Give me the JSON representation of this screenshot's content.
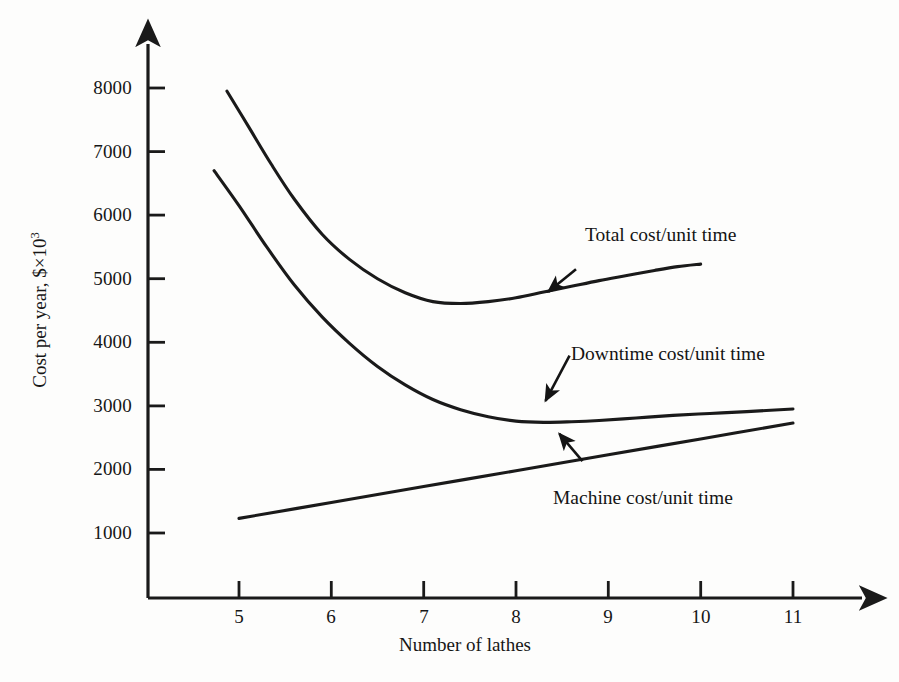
{
  "chart_data": {
    "type": "line",
    "title": "",
    "subtitle": "",
    "xlabel": "Number of lathes",
    "ylabel": "Cost per year, $×10",
    "ylabel_exponent": "3",
    "xlim": [
      4.3,
      11.7
    ],
    "ylim": [
      0,
      8600
    ],
    "xticks": [
      5,
      6,
      7,
      8,
      9,
      10,
      11
    ],
    "xticklabels": [
      "5",
      "6",
      "7",
      "8",
      "9",
      "10",
      "11"
    ],
    "yticks": [
      1000,
      2000,
      3000,
      4000,
      5000,
      6000,
      7000,
      8000
    ],
    "yticklabels": [
      "1000",
      "2000",
      "3000",
      "4000",
      "5000",
      "6000",
      "7000",
      "8000"
    ],
    "grid": false,
    "legend": "none",
    "axis_style": "arrow-tipped-spines",
    "line_color": "#1a1a1a",
    "series": [
      {
        "name": "Total cost/unit time",
        "label": "Total cost/unit time",
        "x": [
          4.87,
          5.1,
          5.35,
          5.6,
          5.9,
          6.2,
          6.5,
          6.8,
          7.1,
          7.4,
          7.7,
          8.0,
          8.3,
          8.6,
          8.9,
          9.2,
          9.5,
          9.75,
          10.0
        ],
        "values": [
          7950,
          7400,
          6800,
          6250,
          5700,
          5300,
          5000,
          4780,
          4640,
          4610,
          4640,
          4700,
          4790,
          4880,
          4970,
          5050,
          5130,
          5190,
          5230
        ]
      },
      {
        "name": "Downtime cost/unit time",
        "label": "Downtime cost/unit time",
        "x": [
          4.73,
          5.0,
          5.3,
          5.6,
          5.9,
          6.2,
          6.5,
          6.8,
          7.1,
          7.4,
          7.7,
          8.0,
          8.3,
          8.6,
          8.9,
          9.3,
          9.7,
          10.1,
          10.5,
          11.0
        ],
        "values": [
          6700,
          6150,
          5500,
          4900,
          4400,
          3980,
          3620,
          3330,
          3100,
          2940,
          2830,
          2760,
          2740,
          2750,
          2770,
          2810,
          2850,
          2880,
          2910,
          2950
        ]
      },
      {
        "name": "Machine cost/unit time",
        "label": "Machine cost/unit time",
        "x": [
          5.0,
          6.0,
          7.0,
          8.0,
          9.0,
          10.0,
          11.0
        ],
        "values": [
          1230,
          1480,
          1730,
          1980,
          2230,
          2480,
          2730
        ]
      }
    ],
    "annotations": [
      {
        "name": "total-cost-annotation",
        "text": "Total cost/unit time",
        "arrow_from": [
          8.65,
          5150
        ],
        "arrow_to": [
          8.35,
          4795
        ]
      },
      {
        "name": "downtime-cost-annotation",
        "text": "Downtime cost/unit time",
        "arrow_from": [
          8.58,
          3790
        ],
        "arrow_to": [
          8.32,
          3080
        ]
      },
      {
        "name": "machine-cost-annotation",
        "text": "Machine cost/unit time",
        "arrow_from": [
          8.72,
          2130
        ],
        "arrow_to": [
          8.47,
          2560
        ]
      }
    ]
  },
  "figure": {
    "x_axis_title": "Number of lathes",
    "y_axis_title_main": "Cost per year, $×10",
    "y_axis_title_sup": "3",
    "xtick_labels": [
      "5",
      "6",
      "7",
      "8",
      "9",
      "10",
      "11"
    ],
    "ytick_labels": [
      "1000",
      "2000",
      "3000",
      "4000",
      "5000",
      "6000",
      "7000",
      "8000"
    ],
    "series_labels": {
      "total": "Total cost/unit time",
      "downtime": "Downtime cost/unit time",
      "machine": "Machine cost/unit time"
    }
  }
}
